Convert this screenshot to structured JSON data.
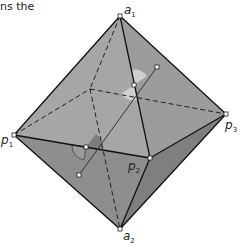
{
  "caption": "ns the",
  "vertices": {
    "a1": {
      "label": "a",
      "sub": "1"
    },
    "a2": {
      "label": "a",
      "sub": "2"
    },
    "p1": {
      "label": "p",
      "sub": "1"
    },
    "p2": {
      "label": "p",
      "sub": "2"
    },
    "p3": {
      "label": "p",
      "sub": "3"
    }
  },
  "colors": {
    "face_light": "#a8a8a8",
    "face_mid": "#9a9a9a",
    "face_dark": "#8a8a8a",
    "face_darker": "#7e7e7e",
    "edge": "#1a1a1a",
    "angle_mark": "#c8c8c8"
  }
}
